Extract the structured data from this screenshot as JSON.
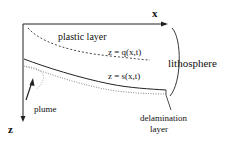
{
  "diagram": {
    "axes": {
      "x_label": "x",
      "z_label": "z"
    },
    "labels": {
      "plastic_layer": "plastic layer",
      "q_curve": "z = q(x,t)",
      "s_curve": "z = s(x,t)",
      "lithosphere": "lithosphere",
      "plume": "plume",
      "delamination_line1": "delamination",
      "delamination_line2": "layer"
    },
    "colors": {
      "line": "#222222",
      "dotted": "#666666"
    }
  }
}
